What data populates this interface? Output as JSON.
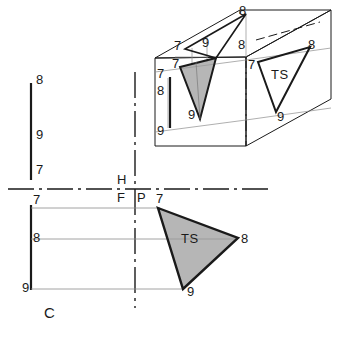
{
  "figure": {
    "caption": "C",
    "colors": {
      "line": "#1a1a1a",
      "thin_line": "#6e6e6e",
      "shade_fill": "#9a9a9a",
      "background": "#ffffff"
    }
  },
  "pictorial": {
    "name": "isometric-box",
    "shaded_triangle_label": "",
    "ts_triangle_label": "TS",
    "vertex_labels": {
      "top_far_8": "8",
      "top_near_9": "9",
      "top_left_7": "7",
      "front_7": "7",
      "front_8": "8",
      "front_9": "9",
      "edge_7": "7",
      "edge_8": "8",
      "edge_9": "9",
      "aux_7": "7",
      "aux_8": "8",
      "aux_9": "9",
      "aux_top_8": "8"
    }
  },
  "orthographic": {
    "reference_line_labels": {
      "horizontal_top": "H",
      "frontal": "F",
      "profile": "P"
    },
    "left_edge_labels": {
      "top_8": "8",
      "mid_9": "9",
      "bottom_7": "7"
    },
    "front_view_labels": {
      "p7": "7",
      "p8": "8",
      "p9": "9"
    },
    "auxiliary_labels": {
      "a7": "7",
      "a8": "8",
      "a9": "9",
      "true_size": "TS"
    }
  }
}
